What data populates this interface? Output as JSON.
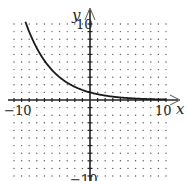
{
  "chart_data": {
    "type": "line",
    "title": "",
    "xlabel": "x",
    "ylabel": "y",
    "xlim": [
      -10,
      10
    ],
    "ylim": [
      -10,
      10
    ],
    "grid": "dots",
    "grid_step": 1,
    "tick_labels": {
      "x_min": "−10",
      "x_max": "10",
      "y_max": "10",
      "y_min": "−10"
    },
    "series": [
      {
        "name": "exponential decay",
        "function": "y = (0.76)^x",
        "x": [
          -8.5,
          -8,
          -7,
          -6,
          -5,
          -4,
          -3,
          -2,
          -1,
          0,
          1,
          2,
          3,
          4,
          5,
          6,
          7,
          8,
          9,
          10
        ],
        "y": [
          10.3,
          9.0,
          6.8,
          5.2,
          3.9,
          3.0,
          2.3,
          1.7,
          1.3,
          1.0,
          0.76,
          0.58,
          0.44,
          0.33,
          0.25,
          0.19,
          0.15,
          0.11,
          0.08,
          0.06
        ]
      }
    ],
    "colors": {
      "curve": "#1a1a1a",
      "axes": "#222222",
      "grid_dots": "#555555"
    }
  }
}
